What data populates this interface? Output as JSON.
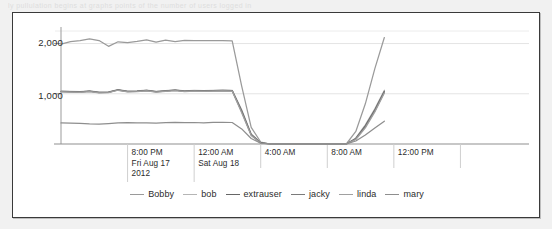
{
  "page": {
    "top_artifact_text": "ly pullulation begins at graphs points of the number of users logged in"
  },
  "chart_data": {
    "type": "line",
    "title": "",
    "xlabel": "",
    "ylabel": "",
    "ylim": [
      0,
      2250
    ],
    "yticks": [
      1000,
      2000
    ],
    "ytick_labels": [
      "1,000",
      "2,000"
    ],
    "grid": true,
    "legend_position": "bottom",
    "x_axis_ticks": [
      {
        "time": "8:00 PM",
        "date": "Fri Aug 17",
        "year": "2012"
      },
      {
        "time": "12:00 AM",
        "date": "Sat Aug 18",
        "year": ""
      },
      {
        "time": "4:00 AM",
        "date": "",
        "year": ""
      },
      {
        "time": "8:00 AM",
        "date": "",
        "year": ""
      },
      {
        "time": "12:00 PM",
        "date": "",
        "year": ""
      }
    ],
    "x": [
      0,
      1,
      2,
      3,
      4,
      5,
      6,
      7,
      8,
      9,
      10,
      11,
      12,
      13,
      14,
      15,
      16,
      17,
      18,
      19,
      20,
      21,
      22,
      23,
      24,
      25,
      26,
      27,
      28,
      29,
      30,
      31,
      32,
      33,
      34
    ],
    "x_hours": [
      "17:00",
      "17:30",
      "18:00",
      "18:30",
      "19:00",
      "19:30",
      "20:00",
      "20:30",
      "21:00",
      "21:30",
      "22:00",
      "22:30",
      "23:00",
      "23:30",
      "00:00",
      "00:30",
      "01:00",
      "01:30",
      "02:00",
      "02:30",
      "03:00",
      "03:30",
      "04:00",
      "04:30",
      "05:00",
      "05:30",
      "06:00",
      "06:30",
      "07:00",
      "07:30",
      "08:00",
      "08:30",
      "09:00",
      "09:30",
      "10:00"
    ],
    "series": [
      {
        "name": "Bobby",
        "color": "#9a9a9a",
        "values": [
          1990,
          2040,
          2060,
          2095,
          2060,
          1945,
          2035,
          2020,
          2045,
          2075,
          2030,
          2070,
          2040,
          2065,
          2060,
          2060,
          2060,
          2060,
          2055,
          1150,
          330,
          40,
          0,
          0,
          0,
          0,
          0,
          0,
          0,
          0,
          0,
          250,
          800,
          1500,
          2120
        ]
      },
      {
        "name": "bob",
        "color": "#b5b5b5",
        "values": [
          1055,
          1050,
          1045,
          1060,
          1035,
          1040,
          1085,
          1055,
          1060,
          1075,
          1050,
          1065,
          1080,
          1060,
          1070,
          1065,
          1070,
          1075,
          1070,
          680,
          200,
          30,
          0,
          0,
          0,
          0,
          0,
          0,
          0,
          0,
          0,
          120,
          380,
          700,
          1070
        ]
      },
      {
        "name": "extrauser",
        "color": "#666666",
        "values": [
          1050,
          1045,
          1040,
          1055,
          1030,
          1035,
          1080,
          1050,
          1055,
          1070,
          1045,
          1060,
          1075,
          1055,
          1065,
          1060,
          1065,
          1070,
          1065,
          660,
          190,
          25,
          0,
          0,
          0,
          0,
          0,
          0,
          0,
          0,
          0,
          110,
          360,
          680,
          1050
        ]
      },
      {
        "name": "jacky",
        "color": "#7a7a7a",
        "values": [
          1045,
          1040,
          1035,
          1050,
          1025,
          1030,
          1075,
          1045,
          1050,
          1065,
          1040,
          1055,
          1070,
          1050,
          1060,
          1055,
          1060,
          1065,
          1060,
          640,
          180,
          20,
          0,
          0,
          0,
          0,
          0,
          0,
          0,
          0,
          0,
          100,
          340,
          660,
          1030
        ]
      },
      {
        "name": "linda",
        "color": "#a0a0a0",
        "values": [
          1040,
          1035,
          1030,
          1045,
          1020,
          1025,
          1070,
          1040,
          1045,
          1060,
          1035,
          1050,
          1065,
          1045,
          1055,
          1050,
          1055,
          1060,
          1055,
          620,
          170,
          15,
          0,
          0,
          0,
          0,
          0,
          0,
          0,
          0,
          0,
          90,
          320,
          640,
          1015
        ]
      },
      {
        "name": "mary",
        "color": "#8e8e8e",
        "values": [
          420,
          415,
          412,
          400,
          398,
          408,
          422,
          425,
          423,
          420,
          418,
          425,
          430,
          424,
          428,
          422,
          430,
          432,
          428,
          300,
          110,
          15,
          0,
          0,
          0,
          0,
          0,
          0,
          0,
          0,
          0,
          60,
          180,
          320,
          455
        ]
      }
    ]
  }
}
